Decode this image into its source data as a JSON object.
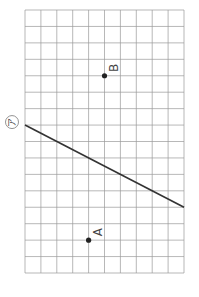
{
  "diagram": {
    "type": "grid-geometry",
    "grid": {
      "columns": 10,
      "rows": 16,
      "line_color": "#9a9a9a"
    },
    "points": [
      {
        "label": "B",
        "col": 5,
        "row": 4
      },
      {
        "label": "A",
        "col": 4,
        "row": 14
      }
    ],
    "line": {
      "label": "ア",
      "from": {
        "col": 0,
        "row": 7
      },
      "to": {
        "col": 10,
        "row": 12
      },
      "color": "#333333"
    },
    "point_color": "#222222",
    "label_color": "#444444"
  }
}
